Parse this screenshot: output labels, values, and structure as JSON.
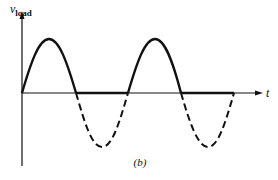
{
  "figure": {
    "label": "(b)",
    "y_axis": {
      "label_main": "v",
      "label_sub": "load"
    },
    "x_axis": {
      "label": "t"
    }
  },
  "colors": {
    "stroke": "#111111",
    "background": "#ffffff"
  },
  "geometry": {
    "origin": [
      22,
      93
    ],
    "x_axis_end": 262,
    "y_axis_top": 12,
    "y_axis_bottom": 166,
    "amplitude": 54,
    "zero_crossings": [
      22,
      76,
      128,
      181,
      234
    ],
    "peaks": [
      [
        49,
        39
      ],
      [
        155,
        39
      ]
    ],
    "troughs": [
      [
        102,
        147
      ],
      [
        208,
        147
      ]
    ]
  }
}
